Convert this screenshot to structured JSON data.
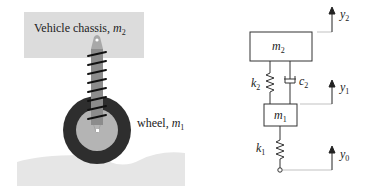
{
  "left_figure": {
    "chassis_label_text": "Vehicle chassis,",
    "chassis_label_var": "m",
    "chassis_label_sub": "2",
    "wheel_label_text": "wheel,",
    "wheel_label_var": "m",
    "wheel_label_sub": "1"
  },
  "right_figure": {
    "mass_top_var": "m",
    "mass_top_sub": "2",
    "mass_bottom_var": "m",
    "mass_bottom_sub": "1",
    "spring_top_var": "k",
    "spring_top_sub": "2",
    "damper_var": "c",
    "damper_sub": "2",
    "spring_bottom_var": "k",
    "spring_bottom_sub": "1",
    "disp_top_var": "y",
    "disp_top_sub": "2",
    "disp_mid_var": "y",
    "disp_mid_sub": "1",
    "disp_bottom_var": "y",
    "disp_bottom_sub": "0"
  },
  "colors": {
    "chassis_fill": "#dcdcdc",
    "road_fill": "#e6e6e6",
    "tire": "#2e2e2e",
    "hub": "#b4b4b4",
    "strut": "#8c8c8c",
    "line": "#333333"
  }
}
